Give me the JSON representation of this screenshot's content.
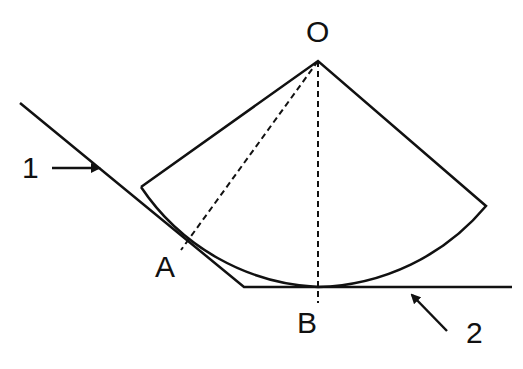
{
  "diagram": {
    "labels": {
      "center": "O",
      "tangent_point_incline": "A",
      "tangent_point_horizontal": "B",
      "surface_1": "1",
      "surface_2": "2"
    },
    "colors": {
      "line": "#111111",
      "background": "#ffffff"
    }
  }
}
